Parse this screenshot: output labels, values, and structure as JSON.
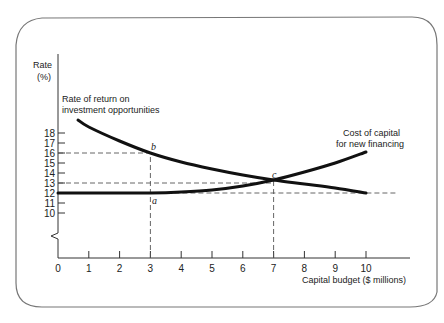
{
  "chart_data": {
    "type": "line",
    "title": "",
    "xlabel": "Capital budget ($ millions)",
    "ylabel_line1": "Rate",
    "ylabel_line2": "(%)",
    "xlim": [
      0,
      10
    ],
    "ylim": [
      10,
      18
    ],
    "y_axis_break": true,
    "grid": false,
    "x_ticks": [
      "0",
      "1",
      "2",
      "3",
      "4",
      "5",
      "6",
      "7",
      "8",
      "9",
      "10"
    ],
    "y_ticks": [
      "10",
      "11",
      "12",
      "13",
      "14",
      "15",
      "16",
      "17",
      "18"
    ],
    "series": [
      {
        "name": "Rate of return on investment opportunities",
        "label_line1": "Rate of return on",
        "label_line2": "investment opportunities",
        "x": [
          0.65,
          1,
          2,
          3,
          4,
          5,
          6,
          7,
          8,
          9,
          10
        ],
        "y": [
          19.3,
          18.6,
          17.2,
          16.0,
          15.1,
          14.4,
          13.8,
          13.3,
          12.9,
          12.5,
          12.0
        ]
      },
      {
        "name": "Cost of capital for new financing",
        "label_line1": "Cost of capital",
        "label_line2": "for new financing",
        "x": [
          0,
          1,
          2,
          3,
          4,
          5,
          6,
          7,
          8,
          9,
          10
        ],
        "y": [
          12.0,
          12.0,
          12.0,
          12.0,
          12.1,
          12.3,
          12.7,
          13.3,
          14.1,
          15.0,
          16.1
        ]
      }
    ],
    "annotations": [
      {
        "label": "a",
        "x": 3,
        "y": 12
      },
      {
        "label": "b",
        "x": 3,
        "y": 16
      },
      {
        "label": "c",
        "x": 7,
        "y": 13.3
      }
    ],
    "reference_lines": [
      {
        "type": "horizontal-dashed",
        "y": 16,
        "from_x": 0,
        "to_x": 3
      },
      {
        "type": "horizontal-dashed",
        "y": 13,
        "from_x": 0,
        "to_x": 7
      },
      {
        "type": "horizontal-dashed",
        "y": 12,
        "from_x": 3,
        "to_x": 11
      },
      {
        "type": "vertical-dashed",
        "x": 3,
        "from_y": 10,
        "to_y": 16
      },
      {
        "type": "vertical-dashed",
        "x": 7,
        "from_y": 10,
        "to_y": 13.3
      }
    ]
  }
}
